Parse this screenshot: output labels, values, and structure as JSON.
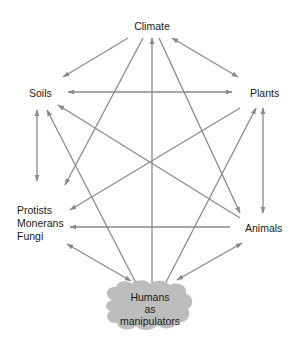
{
  "diagram": {
    "title": "",
    "colors": {
      "arrow": "#8a8a8a",
      "cloud": "#bdbdbd",
      "text": "#1a1a1a"
    },
    "nodes": {
      "climate": {
        "label": "Climate"
      },
      "soils": {
        "label": "Soils"
      },
      "plants": {
        "label": "Plants"
      },
      "protists": {
        "lines": [
          "Protists",
          "Monerans",
          "Fungi"
        ]
      },
      "animals": {
        "label": "Animals"
      },
      "humans": {
        "lines": [
          "Humans",
          "as",
          "manipulators"
        ],
        "shape": "cloud"
      }
    },
    "edges": [
      {
        "from": "climate",
        "to": "soils",
        "direction": "forward"
      },
      {
        "from": "climate",
        "to": "plants",
        "direction": "both"
      },
      {
        "from": "climate",
        "to": "humans",
        "direction": "both"
      },
      {
        "from": "climate",
        "to": "protists",
        "direction": "forward"
      },
      {
        "from": "climate",
        "to": "animals",
        "direction": "forward"
      },
      {
        "from": "soils",
        "to": "plants",
        "direction": "both"
      },
      {
        "from": "animals",
        "to": "soils",
        "direction": "forward"
      },
      {
        "from": "soils",
        "to": "protists",
        "direction": "both"
      },
      {
        "from": "soils",
        "to": "humans",
        "direction": "both"
      },
      {
        "from": "plants",
        "to": "protists",
        "direction": "forward"
      },
      {
        "from": "plants",
        "to": "animals",
        "direction": "both"
      },
      {
        "from": "humans",
        "to": "plants",
        "direction": "forward"
      },
      {
        "from": "plants",
        "to": "animals",
        "direction": "forward",
        "note": "diagonal"
      },
      {
        "from": "animals",
        "to": "protists",
        "direction": "forward"
      },
      {
        "from": "protists",
        "to": "humans",
        "direction": "both"
      },
      {
        "from": "animals",
        "to": "humans",
        "direction": "both"
      }
    ]
  }
}
